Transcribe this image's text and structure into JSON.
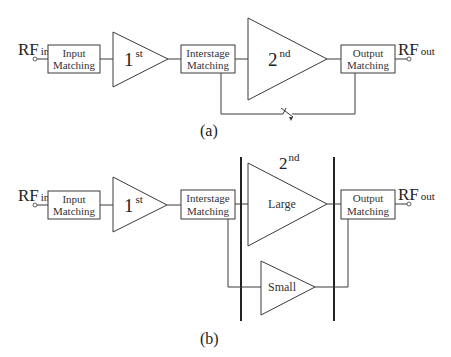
{
  "diagram_a": {
    "caption": "(a)",
    "rf_in": {
      "main": "RF",
      "sub": "in"
    },
    "rf_out": {
      "main": "RF",
      "sub": "out"
    },
    "input_matching": {
      "line1": "Input",
      "line2": "Matching"
    },
    "first_stage": {
      "main": "1",
      "sup": "st"
    },
    "interstage_matching": {
      "line1": "Interstage",
      "line2": "Matching"
    },
    "second_stage": {
      "main": "2",
      "sup": "nd"
    },
    "output_matching": {
      "line1": "Output",
      "line2": "Matching"
    },
    "bypass": {
      "element": "switch"
    }
  },
  "diagram_b": {
    "caption": "(b)",
    "rf_in": {
      "main": "RF",
      "sub": "in"
    },
    "rf_out": {
      "main": "RF",
      "sub": "out"
    },
    "input_matching": {
      "line1": "Input",
      "line2": "Matching"
    },
    "first_stage": {
      "main": "1",
      "sup": "st"
    },
    "interstage_matching": {
      "line1": "Interstage",
      "line2": "Matching"
    },
    "second_stage_label": {
      "main": "2",
      "sup": "nd"
    },
    "large_amp": "Large",
    "small_amp": "Small",
    "output_matching": {
      "line1": "Output",
      "line2": "Matching"
    }
  },
  "colors": {
    "line": "#3a3a3a",
    "text": "#222222",
    "background": "#ffffff"
  }
}
